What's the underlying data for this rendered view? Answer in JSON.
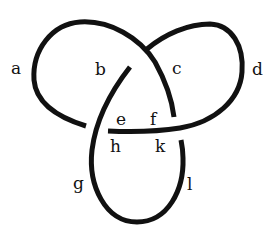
{
  "diagram": {
    "type": "trefoil-knot",
    "stroke_color": "#111111",
    "background": "#ffffff",
    "labels": [
      {
        "id": "a",
        "text": "a",
        "x": 11,
        "y": 60
      },
      {
        "id": "b",
        "text": "b",
        "x": 95,
        "y": 61
      },
      {
        "id": "c",
        "text": "c",
        "x": 172,
        "y": 60
      },
      {
        "id": "d",
        "text": "d",
        "x": 252,
        "y": 61
      },
      {
        "id": "e",
        "text": "e",
        "x": 116,
        "y": 111
      },
      {
        "id": "f",
        "text": "f",
        "x": 150,
        "y": 111
      },
      {
        "id": "h",
        "text": "h",
        "x": 110,
        "y": 138
      },
      {
        "id": "k",
        "text": "k",
        "x": 155,
        "y": 138
      },
      {
        "id": "g",
        "text": "g",
        "x": 73,
        "y": 175
      },
      {
        "id": "l",
        "text": "l",
        "x": 187,
        "y": 176
      }
    ]
  }
}
